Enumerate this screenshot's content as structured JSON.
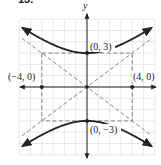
{
  "problem_number": "13.",
  "chart_data": {
    "type": "line",
    "title": "",
    "xlabel": "",
    "ylabel": "y",
    "equation_depicted": "y^2/9 - x^2/16 = 1",
    "xlim": [
      -6,
      6
    ],
    "ylim": [
      -6,
      6
    ],
    "grid": true,
    "grid_step": 1,
    "series": [
      {
        "name": "upper branch",
        "style": "solid",
        "x": [
          -6,
          -4,
          -2,
          0,
          2,
          4,
          6
        ],
        "y": [
          5.41,
          4.24,
          3.35,
          3,
          3.35,
          4.24,
          5.41
        ]
      },
      {
        "name": "lower branch",
        "style": "solid",
        "x": [
          -6,
          -4,
          -2,
          0,
          2,
          4,
          6
        ],
        "y": [
          -5.41,
          -4.24,
          -3.35,
          -3,
          -3.35,
          -4.24,
          -5.41
        ]
      },
      {
        "name": "asymptote y = 3/4 x",
        "style": "dashed",
        "x": [
          -6,
          6
        ],
        "y": [
          -4.5,
          4.5
        ]
      },
      {
        "name": "asymptote y = -3/4 x",
        "style": "dashed",
        "x": [
          -6,
          6
        ],
        "y": [
          4.5,
          -4.5
        ]
      },
      {
        "name": "central rectangle",
        "style": "dashed",
        "x": [
          -4,
          4,
          4,
          -4,
          -4
        ],
        "y": [
          3,
          3,
          -3,
          -3,
          3
        ]
      }
    ],
    "points": [
      {
        "label": "(0, 3)",
        "x": 0,
        "y": 3
      },
      {
        "label": "(0, −3)",
        "x": 0,
        "y": -3
      },
      {
        "label": "(−4, 0)",
        "x": -4,
        "y": 0
      },
      {
        "label": "(4, 0)",
        "x": 4,
        "y": 0
      },
      {
        "label": "",
        "x": 0,
        "y": 0
      }
    ]
  },
  "labels": {
    "y_axis": "y",
    "top_vertex": "(0, 3)",
    "bottom_vertex": "(0, −3)",
    "left_point": "(−4, 0)",
    "right_point": "(4, 0)"
  }
}
